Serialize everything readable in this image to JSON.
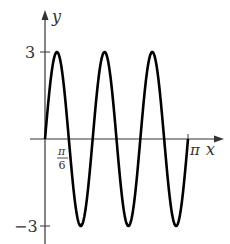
{
  "chart_data": {
    "type": "line",
    "function": "y = 3 sin(6x)",
    "title": "",
    "xlabel": "x",
    "ylabel": "y",
    "xlim": [
      0,
      3.14159
    ],
    "ylim": [
      -3,
      3
    ],
    "x_ticks": [
      {
        "value": 0.5236,
        "label": "π/6"
      },
      {
        "value": 3.14159,
        "label": "π"
      }
    ],
    "y_ticks": [
      {
        "value": 3,
        "label": "3"
      },
      {
        "value": -3,
        "label": "−3"
      }
    ],
    "series": [
      {
        "name": "3 sin 6x",
        "x": [
          0,
          0.2618,
          0.5236,
          0.7854,
          1.0472,
          1.309,
          1.5708,
          1.8326,
          2.0944,
          2.3562,
          2.618,
          2.8798,
          3.1416
        ],
        "values": [
          0,
          3,
          0,
          -3,
          0,
          3,
          0,
          -3,
          0,
          3,
          0,
          -3,
          0
        ]
      }
    ],
    "grid": false,
    "legend": "none"
  },
  "labels": {
    "x_axis": "x",
    "y_axis": "y",
    "y_top": "3",
    "y_bottom": "−3",
    "pi_num": "π",
    "pi_den": "6",
    "pi": "π"
  },
  "colors": {
    "curve": "#000000",
    "axis": "#333333"
  }
}
